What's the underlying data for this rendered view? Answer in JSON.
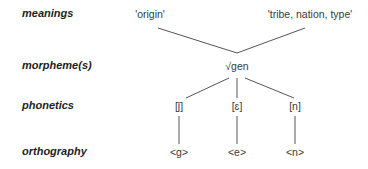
{
  "rows": {
    "meanings": "meanings",
    "morphemes": "morpheme(s)",
    "phonetics": "phonetics",
    "orthography": "orthography"
  },
  "meanings": [
    "'origin'",
    "'tribe, nation, type'"
  ],
  "morpheme": "√gen",
  "phonetics": [
    "[ǰ]",
    "[ɛ]",
    "[n]"
  ],
  "orthography": [
    "<g>",
    "<e>",
    "<n>"
  ],
  "colors": {
    "text": "#2a2a2a",
    "lines": "#555555",
    "background": "#ffffff"
  }
}
